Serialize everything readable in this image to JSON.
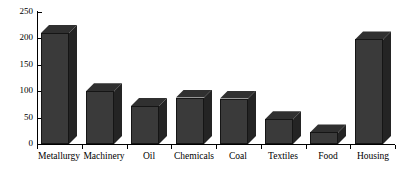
{
  "chart_data": {
    "type": "bar",
    "title": "",
    "subtitle": "",
    "xlabel": "",
    "ylabel": "",
    "categories": [
      "Metallurgy",
      "Machinery",
      "Oil",
      "Chemicals",
      "Coal",
      "Textiles",
      "Food",
      "Housing"
    ],
    "values": [
      210,
      100,
      72,
      88,
      86,
      47,
      22,
      198
    ],
    "series": [
      {
        "name": "",
        "values": [
          210,
          100,
          72,
          88,
          86,
          47,
          22,
          198
        ]
      }
    ],
    "ylim": [
      0,
      250
    ],
    "yticks": [
      0,
      50,
      100,
      150,
      200,
      250
    ],
    "ytick_labels": [
      "0",
      "50",
      "100",
      "150",
      "200",
      "250"
    ],
    "grid": false,
    "legend": false,
    "legend_position": "none",
    "style": "3d-bars",
    "bar_color": "#3a3a3a",
    "bar_top_color": "#303030",
    "bar_side_color": "#242424",
    "bar_edge_color": "#151515",
    "axis_color": "#000000",
    "background_color": "#ffffff"
  }
}
